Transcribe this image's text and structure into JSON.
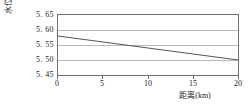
{
  "chart_data": {
    "type": "line",
    "title": "",
    "xlabel": "距离(km)",
    "ylabel": "水位(m)",
    "xlim": [
      0,
      20
    ],
    "ylim": [
      5.45,
      5.65
    ],
    "xticks": [
      0,
      5,
      10,
      15,
      20
    ],
    "xtick_labels": [
      "0",
      "5",
      "10",
      "15",
      "20"
    ],
    "yticks": [
      5.45,
      5.5,
      5.55,
      5.6,
      5.65
    ],
    "ytick_labels": [
      "5. 45",
      "5. 50",
      "5. 55",
      "5. 60",
      "5. 65"
    ],
    "grid": "horizontal",
    "legend": "none",
    "series": [
      {
        "name": "水位",
        "color": "#555555",
        "x": [
          0,
          20
        ],
        "values": [
          5.58,
          5.5
        ]
      }
    ]
  }
}
